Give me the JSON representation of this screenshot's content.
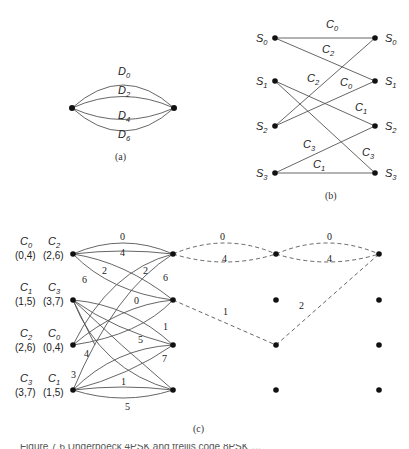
{
  "figure": {
    "panel_a": {
      "caption": "(a)",
      "edges": [
        {
          "letter": "D",
          "sub": "0"
        },
        {
          "letter": "D",
          "sub": "2"
        },
        {
          "letter": "D",
          "sub": "4"
        },
        {
          "letter": "D",
          "sub": "6"
        }
      ]
    },
    "panel_b": {
      "caption": "(b)",
      "left_states": [
        {
          "letter": "S",
          "sub": "0"
        },
        {
          "letter": "S",
          "sub": "1"
        },
        {
          "letter": "S",
          "sub": "2"
        },
        {
          "letter": "S",
          "sub": "3"
        }
      ],
      "right_states": [
        {
          "letter": "S",
          "sub": "0"
        },
        {
          "letter": "S",
          "sub": "1"
        },
        {
          "letter": "S",
          "sub": "2"
        },
        {
          "letter": "S",
          "sub": "3"
        }
      ],
      "edge_labels": [
        {
          "letter": "C",
          "sub": "0",
          "from": "S0",
          "to": "S0"
        },
        {
          "letter": "C",
          "sub": "2",
          "from": "S0",
          "to": "S1"
        },
        {
          "letter": "C",
          "sub": "2",
          "from": "S2",
          "to": "S0"
        },
        {
          "letter": "C",
          "sub": "0",
          "from": "S2",
          "to": "S1"
        },
        {
          "letter": "C",
          "sub": "1",
          "from": "S1",
          "to": "S2"
        },
        {
          "letter": "C",
          "sub": "3",
          "from": "S3",
          "to": "S2"
        },
        {
          "letter": "C",
          "sub": "3",
          "from": "S1",
          "to": "S3"
        },
        {
          "letter": "C",
          "sub": "1",
          "from": "S3",
          "to": "S3"
        }
      ]
    },
    "panel_c": {
      "caption": "(c)",
      "row_labels": [
        {
          "a": {
            "letter": "C",
            "sub": "0",
            "pair": "(0,4)"
          },
          "b": {
            "letter": "C",
            "sub": "2",
            "pair": "(2,6)"
          }
        },
        {
          "a": {
            "letter": "C",
            "sub": "1",
            "pair": "(1,5)"
          },
          "b": {
            "letter": "C",
            "sub": "3",
            "pair": "(3,7)"
          }
        },
        {
          "a": {
            "letter": "C",
            "sub": "2",
            "pair": "(2,6)"
          },
          "b": {
            "letter": "C",
            "sub": "0",
            "pair": "(0,4)"
          }
        },
        {
          "a": {
            "letter": "C",
            "sub": "3",
            "pair": "(3,7)"
          },
          "b": {
            "letter": "C",
            "sub": "1",
            "pair": "(1,5)"
          }
        }
      ],
      "trellis_labels": {
        "r0_top": "0",
        "r0_mid": "4",
        "r0_s1a": "2",
        "r0_s1b": "6",
        "r2_s0": "2",
        "r3_s0": "6",
        "r2_s1": "0",
        "r1_s2": "1",
        "r1_s3": "5",
        "r2_lbl": "4",
        "r3_s2": "7",
        "r3_lbl": "3",
        "r3_top": "1",
        "r3_bot": "5"
      },
      "survivor_labels": {
        "s1_top": "0",
        "s1_bot": "4",
        "s2_top": "0",
        "s2_bot": "4",
        "diag1": "1",
        "diag2": "2"
      }
    },
    "caption_fragment": "Figure 7.6 Ungerboeck 4PSK and trellis code 8PSK …"
  }
}
